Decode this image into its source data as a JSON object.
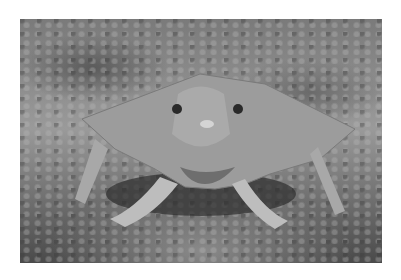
{
  "image": {
    "alt": "Grayscale photograph of a batfish standing on the sandy sea floor on its pectoral fins, facing the camera",
    "subject": "batfish",
    "background": "rocky sandy seabed",
    "color_mode": "grayscale",
    "colors": {
      "page_background": "#ffffff",
      "fish_body": "#9c9c9c",
      "fish_shadow": "#3c3c3c",
      "seabed_light": "#b4b4b4",
      "seabed_dark": "#3a3a3a"
    }
  }
}
